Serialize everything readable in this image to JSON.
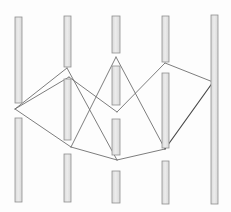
{
  "canvas": {
    "width": 231,
    "height": 212,
    "background": "#fdfdfd"
  },
  "style": {
    "bar_fill": "#d9d9d9",
    "bar_highlight": "#ececec",
    "bar_stroke": "#8f8f8f",
    "bar_stroke_width": 0.8,
    "edge_color": "#6e6e6e",
    "edge_emphasis_color": "#4a4a4a",
    "edge_width": 0.9,
    "edge_emphasis_width": 1.2
  },
  "fences": [
    {
      "name": "fence-1",
      "x": 15,
      "width": 7,
      "bars": [
        {
          "y": 17,
          "height": 86
        },
        {
          "y": 118,
          "height": 84
        }
      ]
    },
    {
      "name": "fence-2",
      "x": 64,
      "width": 7,
      "bars": [
        {
          "y": 16,
          "height": 51
        },
        {
          "y": 79,
          "height": 61
        },
        {
          "y": 154,
          "height": 48
        }
      ]
    },
    {
      "name": "fence-3",
      "x": 112,
      "width": 8,
      "bars": [
        {
          "y": 16,
          "height": 37
        },
        {
          "y": 66,
          "height": 39
        },
        {
          "y": 119,
          "height": 36
        },
        {
          "y": 171,
          "height": 32
        }
      ]
    },
    {
      "name": "fence-4",
      "x": 162,
      "width": 7,
      "bars": [
        {
          "y": 16,
          "height": 46
        },
        {
          "y": 73,
          "height": 75
        },
        {
          "y": 161,
          "height": 43
        }
      ]
    },
    {
      "name": "fence-5",
      "x": 211,
      "width": 7,
      "bars": [
        {
          "y": 15,
          "height": 189
        }
      ]
    }
  ],
  "tour_vertices": {
    "A": [
      15,
      109
    ],
    "B1": [
      67,
      68
    ],
    "B2": [
      69,
      77
    ],
    "C": [
      116,
      57
    ],
    "D": [
      117,
      112
    ],
    "E": [
      71,
      147
    ],
    "F": [
      117,
      160
    ],
    "G": [
      165,
      149
    ],
    "H": [
      213,
      82
    ],
    "I": [
      165,
      63
    ]
  },
  "edges": [
    {
      "name": "edge-A-B1",
      "x1": 15,
      "y1": 109,
      "x2": 67,
      "y2": 68,
      "emphasis": false
    },
    {
      "name": "edge-A-B2",
      "x1": 15,
      "y1": 109,
      "x2": 69,
      "y2": 77,
      "emphasis": false
    },
    {
      "name": "edge-A-E",
      "x1": 15,
      "y1": 109,
      "x2": 71,
      "y2": 147,
      "emphasis": false
    },
    {
      "name": "edge-B2-D",
      "x1": 69,
      "y1": 77,
      "x2": 117,
      "y2": 112,
      "emphasis": false
    },
    {
      "name": "edge-E-C",
      "x1": 71,
      "y1": 147,
      "x2": 116,
      "y2": 57,
      "emphasis": false
    },
    {
      "name": "edge-B1-F",
      "x1": 67,
      "y1": 68,
      "x2": 117,
      "y2": 160,
      "emphasis": false
    },
    {
      "name": "edge-E-F",
      "x1": 71,
      "y1": 147,
      "x2": 117,
      "y2": 160,
      "emphasis": false
    },
    {
      "name": "edge-F-G",
      "x1": 117,
      "y1": 160,
      "x2": 165,
      "y2": 149,
      "emphasis": false
    },
    {
      "name": "edge-C-G",
      "x1": 116,
      "y1": 57,
      "x2": 165,
      "y2": 149,
      "emphasis": false
    },
    {
      "name": "edge-D-I",
      "x1": 117,
      "y1": 112,
      "x2": 165,
      "y2": 63,
      "emphasis": false
    },
    {
      "name": "edge-I-H",
      "x1": 165,
      "y1": 63,
      "x2": 213,
      "y2": 82,
      "emphasis": false
    },
    {
      "name": "edge-G-H",
      "x1": 165,
      "y1": 149,
      "x2": 213,
      "y2": 82,
      "emphasis": true
    }
  ]
}
